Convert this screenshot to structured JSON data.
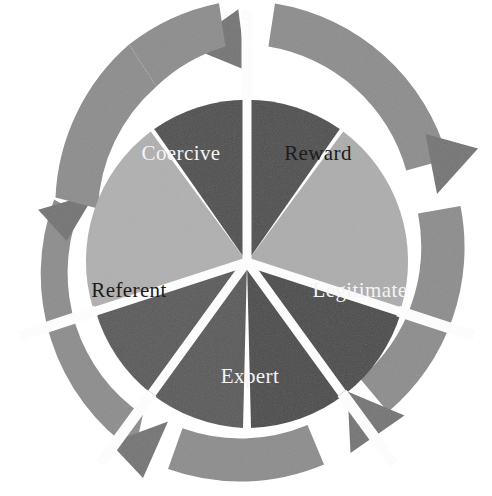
{
  "diagram": {
    "type": "circular-cycle-wheel",
    "segment_count": 5,
    "flow_direction": "clockwise",
    "background_color": "#ffffff",
    "gap_color": "#ffffff",
    "center": {
      "x": 247,
      "y": 262
    },
    "radii": {
      "pie_outer": 162,
      "ring_inner": 172,
      "ring_outer": 215
    },
    "segments": [
      {
        "id": "reward",
        "label": "Reward",
        "order": 1,
        "start_angle": -54,
        "end_angle": 18,
        "fill": "#adadad",
        "ring_fill": "#8d8d8d",
        "label_color": "#1c1c1c",
        "label_x": 318,
        "label_y": 155
      },
      {
        "id": "legitimate",
        "label": "Legitimate",
        "order": 2,
        "start_angle": 18,
        "end_angle": 90,
        "fill": "#4b4b4b",
        "ring_fill": "#8d8d8d",
        "label_color": "#f4f4f4",
        "label_x": 360,
        "label_y": 292
      },
      {
        "id": "expert",
        "label": "Expert",
        "order": 3,
        "start_angle": 90,
        "end_angle": 162,
        "fill": "#5a5a5a",
        "ring_fill": "#8d8d8d",
        "label_color": "#f4f4f4",
        "label_x": 250,
        "label_y": 378
      },
      {
        "id": "referent",
        "label": "Referent",
        "order": 4,
        "start_angle": 162,
        "end_angle": 234,
        "fill": "#b0b0b0",
        "ring_fill": "#8d8d8d",
        "label_color": "#1c1c1c",
        "label_x": 129,
        "label_y": 292
      },
      {
        "id": "coercive",
        "label": "Coercive",
        "order": 5,
        "start_angle": 234,
        "end_angle": 306,
        "fill": "#4f4f4f",
        "ring_fill": "#8d8d8d",
        "label_color": "#f4f4f4",
        "label_x": 181,
        "label_y": 155
      }
    ],
    "arrows": [
      {
        "id": "arrow-top",
        "points_to": "reward"
      },
      {
        "id": "arrow-right",
        "points_to": "legitimate"
      },
      {
        "id": "arrow-bottom-right",
        "points_to": "expert"
      },
      {
        "id": "arrow-bottom-left",
        "points_to": "referent"
      },
      {
        "id": "arrow-left",
        "points_to": "coercive"
      }
    ]
  }
}
